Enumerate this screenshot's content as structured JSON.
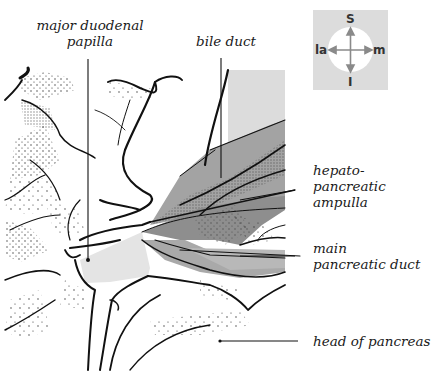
{
  "figure": {
    "type": "anatomical-diagram"
  },
  "labels": {
    "major_duodenal_papilla": {
      "line1": "major duodenal",
      "line2": "papilla"
    },
    "bile_duct": "bile duct",
    "hepatopancreatic_ampulla": {
      "line1": "hepato-",
      "line2": "pancreatic",
      "line3": "ampulla"
    },
    "main_pancreatic_duct": {
      "line1": "main",
      "line2": "pancreatic duct"
    },
    "head_of_pancreas": "head of pancreas"
  },
  "orientation": {
    "superior": "S",
    "inferior": "I",
    "lateral": "la",
    "medial": "m"
  },
  "colors": {
    "outline": "#111111",
    "light_shade": "#d8d8d8",
    "mid_shade": "#a9a9a9",
    "dark_shade": "#8c8c8c",
    "stipple": "#333333",
    "compass_bg": "#dcdcdc",
    "arrow": "#8a8a8a"
  }
}
